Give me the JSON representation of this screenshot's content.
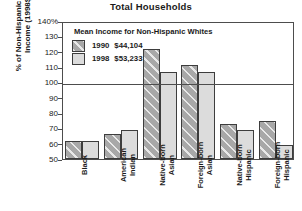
{
  "chart_data": {
    "type": "bar",
    "title": "Total Households",
    "xlabel": "",
    "ylabel_line1": "% of Non-Hispanic White",
    "ylabel_line2": "Income (1998$)",
    "ylim": [
      50,
      140
    ],
    "yticks": [
      {
        "value": 140,
        "label": "140%"
      },
      {
        "value": 130,
        "label": "130"
      },
      {
        "value": 120,
        "label": "120"
      },
      {
        "value": 110,
        "label": "110"
      },
      {
        "value": 100,
        "label": "100"
      },
      {
        "value": 90,
        "label": "90"
      },
      {
        "value": 80,
        "label": "80"
      },
      {
        "value": 70,
        "label": "70"
      },
      {
        "value": 60,
        "label": "60"
      },
      {
        "value": 50,
        "label": "50"
      }
    ],
    "reference_line": 100,
    "grid": false,
    "legend_position": "upper-left-inside",
    "legend_title": "Mean Income for Non-Hispanic Whites",
    "categories": [
      "Black",
      "American\nIndian",
      "Native-born\nAsian",
      "Foreign-born\nAsian",
      "Native-born\nHispanic",
      "Foreign-born\nHispanic"
    ],
    "series": [
      {
        "name": "1990",
        "legend_label": "1990",
        "legend_value": "$44,104",
        "color": "#a8a8a8",
        "values": [
          62,
          66,
          122,
          111,
          73,
          75
        ]
      },
      {
        "name": "1998",
        "legend_label": "1998",
        "legend_value": "$53,233",
        "color": "#dcdcdc",
        "values": [
          62,
          69,
          107,
          107,
          69,
          59
        ]
      }
    ]
  }
}
